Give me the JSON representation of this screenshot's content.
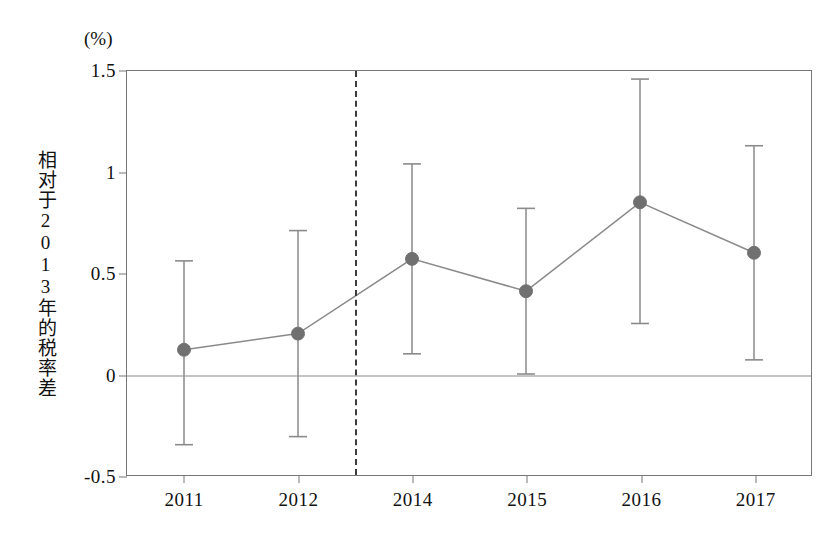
{
  "figure": {
    "unit_annotation": "(%)",
    "ylabel": "相对于2013年的税率差",
    "marker_color": "#707070",
    "line_color": "#8a8a8a",
    "errorbar_color": "#8a8a8a",
    "cutoff_color": "#3c3c3c",
    "axis_color": "#777777"
  },
  "chart_data": {
    "type": "line",
    "title": "",
    "subtitle": "",
    "xlabel": "",
    "ylabel": "相对于2013年的税率差",
    "unit": "(%)",
    "categories": [
      "2011",
      "2012",
      "2014",
      "2015",
      "2016",
      "2017"
    ],
    "x_tick_labels": [
      "2011",
      "2012",
      "2014",
      "2015",
      "2016",
      "2017"
    ],
    "y_tick_labels": [
      "1.5",
      "1",
      "0.5",
      "0",
      "-0.5"
    ],
    "y_ticks": [
      1.5,
      1,
      0.5,
      0,
      -0.5
    ],
    "ylim": [
      -0.5,
      1.5
    ],
    "grid": false,
    "legend": null,
    "series": [
      {
        "name": "相对于2013年的税率差",
        "values": [
          0.12,
          0.2,
          0.57,
          0.41,
          0.85,
          0.6
        ],
        "ci_lower": [
          -0.35,
          -0.31,
          0.1,
          0.0,
          0.25,
          0.07
        ],
        "ci_upper": [
          0.56,
          0.71,
          1.04,
          0.82,
          1.46,
          1.13
        ],
        "marker": "circle",
        "errorbars": true
      }
    ],
    "annotations": [
      {
        "type": "vertical-dashed-line",
        "label": "2013 policy cutoff",
        "between": [
          "2012",
          "2014"
        ],
        "x_value": 2013
      },
      {
        "type": "horizontal-reference-line",
        "label": "zero line",
        "y_value": 0
      }
    ]
  }
}
